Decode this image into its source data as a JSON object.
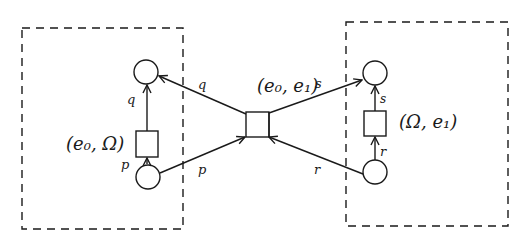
{
  "diagram": {
    "type": "petri-net",
    "components": [
      {
        "id": "left-component",
        "style": "dashed-box"
      },
      {
        "id": "right-component",
        "style": "dashed-box"
      }
    ],
    "transitions": {
      "left": {
        "label": "(e₀, Ω)"
      },
      "center": {
        "label": "(e₀, e₁)"
      },
      "right": {
        "label": "(Ω, e₁)"
      }
    },
    "arc_labels": {
      "left_in": "p",
      "left_out": "q",
      "center_in_left": "p",
      "center_out_left": "q",
      "center_out_right": "s",
      "center_in_right": "r",
      "right_in": "r",
      "right_out": "s"
    },
    "colors": {
      "stroke": "#1a1a1a",
      "background": "#ffffff"
    }
  }
}
